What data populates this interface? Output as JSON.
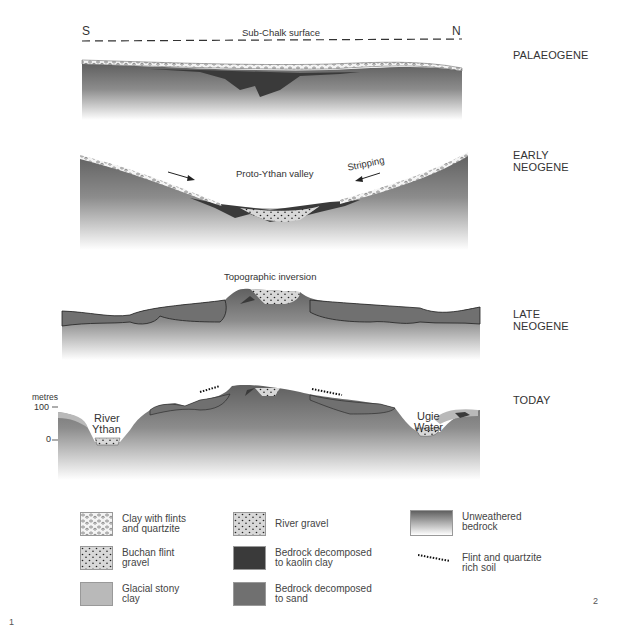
{
  "orientation": {
    "left": "S",
    "right": "N"
  },
  "panels": [
    {
      "era": "PALAEOGENE",
      "annotations": [
        "Sub-Chalk surface"
      ]
    },
    {
      "era": "EARLY NEOGENE",
      "annotations": [
        "Proto-Ythan valley",
        "Stripping"
      ]
    },
    {
      "era": "LATE NEOGENE",
      "annotations": [
        "Topographic inversion"
      ]
    },
    {
      "era": "TODAY",
      "annotations": [
        "River Ythan",
        "Ugie Water"
      ]
    }
  ],
  "axis": {
    "unit": "metres",
    "ticks": [
      "100",
      "0"
    ]
  },
  "labels": {
    "sub_chalk": "Sub-Chalk surface",
    "proto_ythan": "Proto-Ythan valley",
    "stripping": "Stripping",
    "topo_inversion": "Topographic inversion",
    "river_ythan_1": "River",
    "river_ythan_2": "Ythan",
    "ugie_1": "Ugie",
    "ugie_2": "Water"
  },
  "legend": [
    {
      "label": "Clay with flints\nand quartzite",
      "pattern": "clay-flints"
    },
    {
      "label": "Buchan flint\ngravel",
      "pattern": "buchan-gravel"
    },
    {
      "label": "Glacial stony\nclay",
      "pattern": "glacial-clay",
      "color": "#b9b9b9"
    },
    {
      "label": "River gravel",
      "pattern": "river-gravel"
    },
    {
      "label": "Bedrock decomposed\nto kaolin clay",
      "color": "#3a3a3a"
    },
    {
      "label": "Bedrock decomposed\nto sand",
      "color": "#707070"
    },
    {
      "label": "Unweathered\nbedrock",
      "pattern": "gradient"
    },
    {
      "label": "Flint and quartzite\nrich soil",
      "pattern": "dotted-line"
    }
  ],
  "figure_numbers": {
    "left": "1",
    "right": "2"
  },
  "colors": {
    "bedrock_top": "#6b6b6b",
    "bedrock_bottom": "#ffffff",
    "sand": "#707070",
    "kaolin": "#3a3a3a",
    "glacial_clay": "#b9b9b9",
    "gravel_fill": "#d6d6d6"
  }
}
